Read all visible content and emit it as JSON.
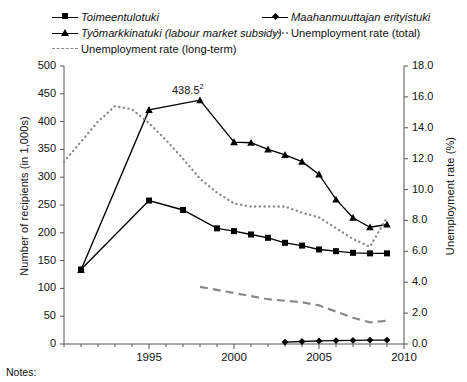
{
  "figure": {
    "notes_label": "Notes:",
    "annotation": {
      "text": "438.5",
      "superscript": "2",
      "x": 1998,
      "y": 438.5
    }
  },
  "legend": {
    "position": "top",
    "items": [
      {
        "label": "Toimeentulotuki",
        "style": "solid-line-square-marker",
        "italic": true,
        "color": "#000000"
      },
      {
        "label": "Työmarkkinatuki (labour market subsidy)",
        "style": "solid-line-triangle-marker",
        "italic": true,
        "color": "#000000"
      },
      {
        "label": "Unemployment rate (long-term)",
        "style": "dashed-line",
        "italic": false,
        "color": "#8a8a8a"
      },
      {
        "label": "Maahanmuuttajan erityistuki",
        "style": "solid-line-diamond-marker",
        "italic": true,
        "color": "#000000"
      },
      {
        "label": "Unemployment rate (total)",
        "style": "dotted-line",
        "italic": false,
        "color": "#8a8a8a"
      }
    ]
  },
  "chart_data": {
    "type": "line",
    "title": "",
    "xlabel": "",
    "ylabel": "Number of recipients (in 1,000s)",
    "y2label": "Unemployment rate (%)",
    "xlim": [
      1990,
      2010
    ],
    "ylim": [
      0,
      500
    ],
    "y2lim": [
      0,
      18
    ],
    "grid": false,
    "x_ticks": [
      1990,
      1991,
      1992,
      1993,
      1994,
      1995,
      1996,
      1997,
      1998,
      1999,
      2000,
      2001,
      2002,
      2003,
      2004,
      2005,
      2006,
      2007,
      2008,
      2009,
      2010
    ],
    "x_tick_labels": [
      "",
      "",
      "",
      "",
      "",
      "1995",
      "",
      "",
      "",
      "",
      "2000",
      "",
      "",
      "",
      "",
      "2005",
      "",
      "",
      "",
      "",
      "2010"
    ],
    "y_ticks": [
      0,
      50,
      100,
      150,
      200,
      250,
      300,
      350,
      400,
      450,
      500
    ],
    "y_tick_labels": [
      "0",
      "50",
      "100",
      "150",
      "200",
      "250",
      "300",
      "350",
      "400",
      "450",
      "500"
    ],
    "y2_ticks": [
      0,
      2,
      4,
      6,
      8,
      10,
      12,
      14,
      16,
      18
    ],
    "y2_tick_labels": [
      "0.0",
      "2.0",
      "4.0",
      "6.0",
      "8.0",
      "10.0",
      "12.0",
      "14.0",
      "16.0",
      "18.0"
    ],
    "series": [
      {
        "name": "Toimeentulotuki",
        "axis": "left",
        "marker": "square",
        "line": "solid",
        "color": "#000000",
        "x": [
          1991,
          1995,
          1997,
          1999,
          2000,
          2001,
          2002,
          2003,
          2004,
          2005,
          2006,
          2007,
          2008,
          2009
        ],
        "values": [
          134,
          258,
          241,
          208,
          203,
          197,
          191,
          182,
          177,
          170,
          167,
          164,
          163,
          163
        ]
      },
      {
        "name": "Työmarkkinatuki (labour market subsidy)",
        "axis": "left",
        "marker": "triangle",
        "line": "solid",
        "color": "#000000",
        "x": [
          1991,
          1995,
          1998,
          2000,
          2001,
          2002,
          2003,
          2004,
          2005,
          2006,
          2007,
          2008,
          2009
        ],
        "values": [
          133,
          421,
          438.5,
          363,
          362,
          350,
          340,
          328,
          305,
          260,
          227,
          210,
          215
        ]
      },
      {
        "name": "Maahanmuuttajan erityistuki",
        "axis": "left",
        "marker": "diamond",
        "line": "solid",
        "color": "#000000",
        "x": [
          2003,
          2004,
          2005,
          2006,
          2007,
          2008,
          2009
        ],
        "values": [
          3.5,
          4.5,
          5.5,
          6,
          6.5,
          7,
          7
        ]
      },
      {
        "name": "Unemployment rate (total)",
        "axis": "right",
        "marker": "none",
        "line": "dotted",
        "color": "#8a8a8a",
        "x": [
          1990,
          1991,
          1992,
          1993,
          1994,
          1995,
          1996,
          1997,
          1998,
          1999,
          2000,
          2001,
          2002,
          2003,
          2004,
          2005,
          2006,
          2007,
          2008,
          2009
        ],
        "values": [
          11.8,
          13.1,
          14.4,
          15.4,
          15.2,
          14.3,
          13.2,
          12.0,
          10.7,
          9.8,
          9.1,
          8.9,
          8.9,
          8.9,
          8.5,
          8.2,
          7.5,
          6.8,
          6.3,
          8.2
        ]
      },
      {
        "name": "Unemployment rate (long-term)",
        "axis": "right",
        "marker": "none",
        "line": "dashed",
        "color": "#8a8a8a",
        "x": [
          1998,
          1999,
          2000,
          2001,
          2002,
          2003,
          2004,
          2005,
          2006,
          2007,
          2008,
          2009
        ],
        "values": [
          3.7,
          3.5,
          3.3,
          3.1,
          2.9,
          2.8,
          2.7,
          2.5,
          2.1,
          1.7,
          1.4,
          1.5
        ]
      }
    ]
  }
}
